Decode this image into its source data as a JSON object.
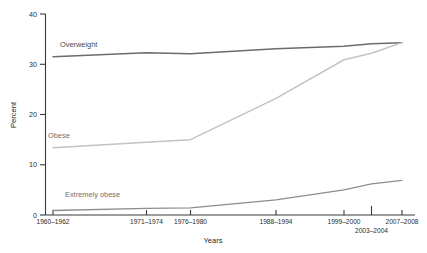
{
  "chart_data": {
    "type": "line",
    "title": "",
    "xlabel": "Years",
    "ylabel": "Percent",
    "ylim": [
      0,
      40
    ],
    "yticks": [
      0,
      10,
      20,
      30,
      40
    ],
    "ytick_labels": [
      "0",
      "10",
      "20",
      "30",
      "40"
    ],
    "grid": false,
    "legend": "inline-labels",
    "categories": [
      "1960-1962",
      "1971-1974",
      "1976-1980",
      "1988-1994",
      "1999-2000",
      "2003-2004",
      "2007-2008"
    ],
    "xtick_labels": [
      "1960–1962",
      "1971–1974",
      "1976–1980",
      "1988–1994",
      "1999–2000",
      "2003–2004",
      "2007–2008"
    ],
    "series": [
      {
        "name": "Overweight",
        "label": "Overweight",
        "color": "#6b6b6b",
        "values": [
          31.5,
          32.3,
          32.1,
          33.1,
          33.6,
          34.1,
          34.3
        ]
      },
      {
        "name": "Obese",
        "label": "Obese",
        "color": "#c3c3c3",
        "values": [
          13.4,
          14.5,
          15.0,
          23.2,
          30.9,
          32.2,
          34.3
        ]
      },
      {
        "name": "Extremely obese",
        "label": "Extremely obese",
        "color": "#8d8d8d",
        "values": [
          0.9,
          1.3,
          1.4,
          3.0,
          5.0,
          6.2,
          6.9
        ]
      }
    ],
    "annotations": [
      {
        "name": "overweight-label",
        "text": "Overweight"
      },
      {
        "name": "obese-label",
        "text": "Obese"
      },
      {
        "name": "extremely-obese-label",
        "text": "Extremely obese"
      }
    ]
  },
  "axes": {
    "y_title": "Percent",
    "x_title": "Years"
  },
  "colors": {
    "axis": "#3a3a3a",
    "overweight": "#6b6b6b",
    "obese": "#c3c3c3",
    "extremely_obese": "#8d8d8d",
    "background": "#ffffff"
  },
  "footnote": {
    "text": ""
  }
}
